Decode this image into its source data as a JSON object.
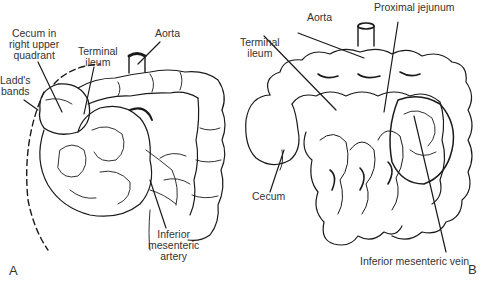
{
  "figure": {
    "panels": [
      {
        "letter": "A",
        "labels": {
          "cecum_line1": "Cecum in",
          "cecum_line2": "right upper",
          "cecum_line3": "quadrant",
          "terminal_line1": "Terminal",
          "terminal_line2": "ileum",
          "aorta": "Aorta",
          "ladds_line1": "Ladd's",
          "ladds_line2": "bands",
          "ima_line1": "Inferior",
          "ima_line2": "mesenteric",
          "ima_line3": "artery"
        }
      },
      {
        "letter": "B",
        "labels": {
          "aorta": "Aorta",
          "proximal_jejunum": "Proximal jejunum",
          "terminal_line1": "Terminal",
          "terminal_line2": "ileum",
          "cecum": "Cecum",
          "imv": "Inferior mesenteric vein"
        }
      }
    ]
  }
}
